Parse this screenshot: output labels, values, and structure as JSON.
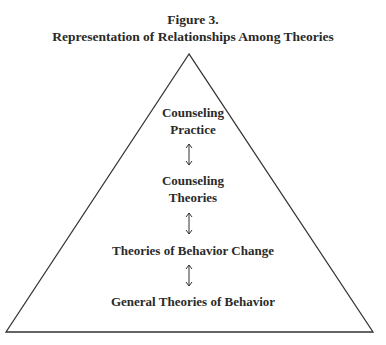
{
  "figure": {
    "number_label": "Figure 3.",
    "title": "Representation of Relationships Among Theories"
  },
  "diagram": {
    "shape": "triangle",
    "levels": [
      {
        "line1": "Counseling",
        "line2": "Practice"
      },
      {
        "line1": "Counseling",
        "line2": "Theories"
      },
      {
        "line1": "Theories of Behavior Change",
        "line2": ""
      },
      {
        "line1": "General Theories of Behavior",
        "line2": ""
      }
    ],
    "connectors": [
      "double-arrow",
      "double-arrow",
      "double-arrow"
    ],
    "line_color": "#333333"
  }
}
